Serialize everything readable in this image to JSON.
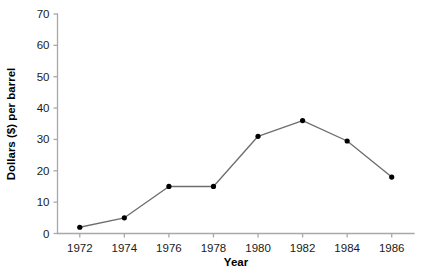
{
  "chart_data": {
    "type": "line",
    "title": "",
    "xlabel": "Year",
    "ylabel": "Dollars ($) per barrel",
    "x": [
      1972,
      1974,
      1976,
      1978,
      1980,
      1982,
      1984,
      1986
    ],
    "values": [
      2,
      5,
      15,
      15,
      31,
      36,
      29.5,
      18
    ],
    "xtick_labels": [
      "1972",
      "1974",
      "1976",
      "1978",
      "1980",
      "1982",
      "1984",
      "1986"
    ],
    "ytick_labels": [
      "0",
      "10",
      "20",
      "30",
      "40",
      "50",
      "60",
      "70"
    ],
    "yticks": [
      0,
      10,
      20,
      30,
      40,
      50,
      60,
      70
    ],
    "ylim": [
      0,
      70
    ],
    "xlim": [
      1971,
      1987
    ],
    "grid": false,
    "legend": false,
    "marker": "circle",
    "line_color": "#6e6e6e",
    "marker_color": "#000000",
    "axis_color": "#a8a8a8",
    "background": "#ffffff"
  },
  "axes": {
    "y_title": "Dollars ($) per barrel",
    "x_title": "Year"
  }
}
